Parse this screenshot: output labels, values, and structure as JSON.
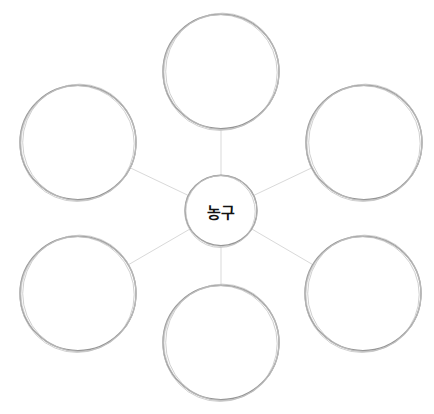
{
  "diagram": {
    "type": "mind-map / bubble map",
    "center": {
      "label": "농구",
      "cx": 221,
      "cy": 211,
      "r": 36
    },
    "nodes": [
      {
        "id": "top",
        "label": "",
        "cx": 221,
        "cy": 72,
        "r": 58
      },
      {
        "id": "upper-right",
        "label": "",
        "cx": 364,
        "cy": 143,
        "r": 58
      },
      {
        "id": "lower-right",
        "label": "",
        "cx": 363,
        "cy": 294,
        "r": 58
      },
      {
        "id": "bottom",
        "label": "",
        "cx": 221,
        "cy": 343,
        "r": 58
      },
      {
        "id": "lower-left",
        "label": "",
        "cx": 78,
        "cy": 294,
        "r": 58
      },
      {
        "id": "upper-left",
        "label": "",
        "cx": 78,
        "cy": 143,
        "r": 58
      }
    ],
    "colors": {
      "circle_stroke": "#8a8a8a",
      "circle_stroke_light": "#bdbdbd",
      "connector": "#d9d9d9",
      "text": "#111111"
    }
  }
}
